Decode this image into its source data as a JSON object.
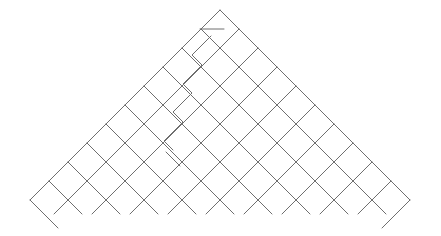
{
  "figure": {
    "title": "Diagonal lattice triangle line drawing",
    "width": 441,
    "height": 236,
    "background_color": "#ffffff",
    "line_color": "#6e6e6e",
    "line_width": 1
  },
  "geometry": {
    "apex": {
      "x": 220,
      "y": 10
    },
    "base_left": {
      "x": 30,
      "y": 200
    },
    "base_right": {
      "x": 410,
      "y": 200
    },
    "grid_spacing": 38,
    "half_spacing": 19,
    "diagonal_angle_deg": 45,
    "base_y": 200,
    "overhang_depth": 28
  },
  "elements": {
    "left_edge_label": "left 45 degree edge",
    "right_edge_label": "right 45 degree edge",
    "lattice_label": "diagonal lattice grid",
    "zigzag_label": "stair step zigzag anomaly",
    "stub_top_label": "upper short stub",
    "stub_bottom_label": "lower short stub",
    "corner_stub_left_label": "left corner overhang",
    "corner_stub_right_label": "right corner overhang",
    "base_overhangs_label": "base vertex overhangs"
  },
  "chart_data": {
    "type": "diagram",
    "title": "Diagonal lattice triangle",
    "grid": true,
    "legend": "none",
    "xlim": [
      0,
      441
    ],
    "ylim": [
      0,
      236
    ],
    "lattice_lines_down_right": [
      {
        "from": [
          30,
          200
        ],
        "to": [
          220,
          10
        ]
      },
      {
        "from": [
          68,
          200
        ],
        "to": [
          239,
          29
        ]
      },
      {
        "from": [
          106,
          200
        ],
        "to": [
          258,
          48
        ]
      },
      {
        "from": [
          144,
          200
        ],
        "to": [
          277,
          67
        ]
      },
      {
        "from": [
          182,
          200
        ],
        "to": [
          296,
          86
        ]
      },
      {
        "from": [
          220,
          200
        ],
        "to": [
          315,
          105
        ]
      },
      {
        "from": [
          258,
          200
        ],
        "to": [
          334,
          124
        ]
      },
      {
        "from": [
          296,
          200
        ],
        "to": [
          353,
          143
        ]
      },
      {
        "from": [
          334,
          200
        ],
        "to": [
          372,
          162
        ]
      },
      {
        "from": [
          372,
          200
        ],
        "to": [
          391,
          181
        ]
      }
    ],
    "lattice_lines_down_left": [
      {
        "from": [
          410,
          200
        ],
        "to": [
          220,
          10
        ]
      },
      {
        "from": [
          372,
          200
        ],
        "to": [
          201,
          29
        ]
      },
      {
        "from": [
          334,
          200
        ],
        "to": [
          182,
          48
        ]
      },
      {
        "from": [
          296,
          200
        ],
        "to": [
          163,
          67
        ]
      },
      {
        "from": [
          258,
          200
        ],
        "to": [
          144,
          86
        ]
      },
      {
        "from": [
          220,
          200
        ],
        "to": [
          125,
          105
        ]
      },
      {
        "from": [
          182,
          200
        ],
        "to": [
          106,
          124
        ]
      },
      {
        "from": [
          144,
          200
        ],
        "to": [
          87,
          143
        ]
      },
      {
        "from": [
          106,
          200
        ],
        "to": [
          68,
          162
        ]
      },
      {
        "from": [
          68,
          200
        ],
        "to": [
          49,
          181
        ]
      }
    ],
    "overhang_segments": [
      {
        "from": [
          30,
          200
        ],
        "to": [
          58,
          228
        ]
      },
      {
        "from": [
          68,
          200
        ],
        "to": [
          54,
          214
        ]
      },
      {
        "from": [
          68,
          200
        ],
        "to": [
          82,
          214
        ]
      },
      {
        "from": [
          106,
          200
        ],
        "to": [
          92,
          214
        ]
      },
      {
        "from": [
          106,
          200
        ],
        "to": [
          120,
          214
        ]
      },
      {
        "from": [
          144,
          200
        ],
        "to": [
          130,
          214
        ]
      },
      {
        "from": [
          144,
          200
        ],
        "to": [
          158,
          214
        ]
      },
      {
        "from": [
          182,
          200
        ],
        "to": [
          168,
          214
        ]
      },
      {
        "from": [
          182,
          200
        ],
        "to": [
          196,
          214
        ]
      },
      {
        "from": [
          220,
          200
        ],
        "to": [
          206,
          214
        ]
      },
      {
        "from": [
          220,
          200
        ],
        "to": [
          234,
          214
        ]
      },
      {
        "from": [
          258,
          200
        ],
        "to": [
          244,
          214
        ]
      },
      {
        "from": [
          258,
          200
        ],
        "to": [
          272,
          214
        ]
      },
      {
        "from": [
          296,
          200
        ],
        "to": [
          282,
          214
        ]
      },
      {
        "from": [
          296,
          200
        ],
        "to": [
          310,
          214
        ]
      },
      {
        "from": [
          334,
          200
        ],
        "to": [
          320,
          214
        ]
      },
      {
        "from": [
          334,
          200
        ],
        "to": [
          348,
          214
        ]
      },
      {
        "from": [
          372,
          200
        ],
        "to": [
          358,
          214
        ]
      },
      {
        "from": [
          372,
          200
        ],
        "to": [
          386,
          214
        ]
      },
      {
        "from": [
          410,
          200
        ],
        "to": [
          382,
          228
        ]
      }
    ],
    "zigzag_path": [
      [
        211,
        36
      ],
      [
        192,
        55
      ],
      [
        202,
        65
      ],
      [
        183,
        84
      ],
      [
        192,
        93
      ],
      [
        173,
        112
      ],
      [
        183,
        122
      ],
      [
        164,
        141
      ],
      [
        173,
        150
      ]
    ],
    "stub_segments": [
      {
        "from": [
          200,
          29
        ],
        "to": [
          224,
          29
        ]
      },
      {
        "from": [
          166,
          152
        ],
        "to": [
          180,
          166
        ]
      }
    ]
  }
}
